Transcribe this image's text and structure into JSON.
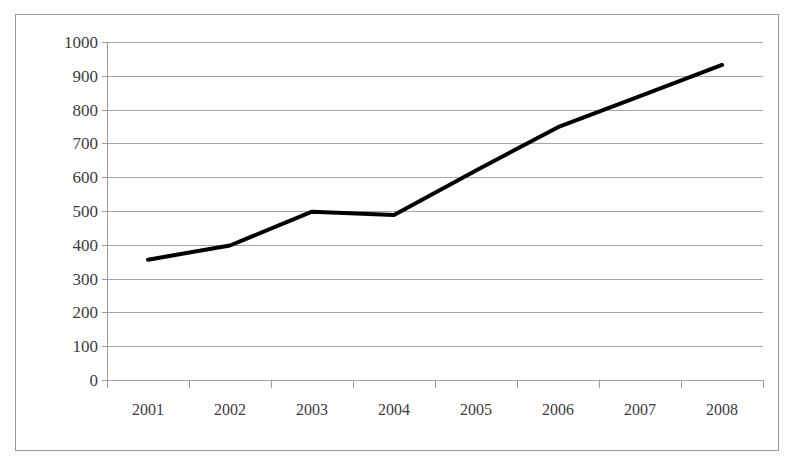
{
  "chart_data": {
    "type": "line",
    "title": "",
    "subtitle": "",
    "xlabel": "",
    "ylabel": "",
    "categories": [
      "2001",
      "2002",
      "2003",
      "2004",
      "2005",
      "2006",
      "2007",
      "2008"
    ],
    "x": [
      2001,
      2002,
      2003,
      2004,
      2005,
      2006,
      2007,
      2008
    ],
    "series": [
      {
        "name": "",
        "values": [
          356,
          398,
          498,
          488,
          620,
          748,
          840,
          932
        ],
        "color": "#000000",
        "line_width": 4,
        "markers": false
      }
    ],
    "ylim": [
      0,
      1000
    ],
    "ytick_values": [
      0,
      100,
      200,
      300,
      400,
      500,
      600,
      700,
      800,
      900,
      1000
    ],
    "ytick_labels": [
      "0",
      "100",
      "200",
      "300",
      "400",
      "500",
      "600",
      "700",
      "800",
      "900",
      "1000"
    ],
    "xtick_labels": [
      "2001",
      "2002",
      "2003",
      "2004",
      "2005",
      "2006",
      "2007",
      "2008"
    ],
    "grid": true,
    "grid_axis": "y",
    "grid_color": "#a6a6a6",
    "legend": false,
    "legend_position": "none",
    "annotations": [],
    "plot_border": "#9a9a9a",
    "background": "#ffffff"
  }
}
